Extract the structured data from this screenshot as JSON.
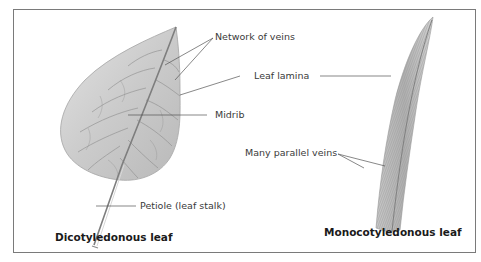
{
  "diagram": {
    "type": "labeled-illustration",
    "colors": {
      "frame": "#7a7a7a",
      "leaf_fill": "#cfcfcf",
      "leaf_shadow": "#a8a8a8",
      "vein": "#8a8a8a",
      "callout_line": "#555555",
      "label_text": "#3a3a3a",
      "caption_text": "#1a1a1a"
    },
    "dicot": {
      "caption": "Dicotyledonous leaf",
      "labels": {
        "network_of_veins": "Network of veins",
        "leaf_lamina": "Leaf lamina",
        "midrib": "Midrib",
        "petiole": "Petiole (leaf stalk)"
      }
    },
    "monocot": {
      "caption": "Monocotyledonous leaf",
      "labels": {
        "parallel_veins": "Many parallel veins"
      }
    }
  }
}
